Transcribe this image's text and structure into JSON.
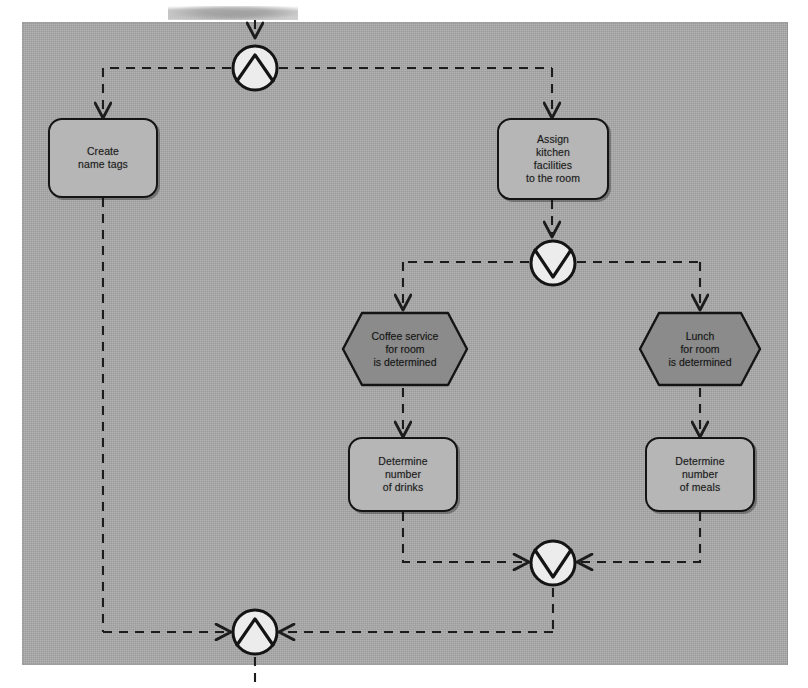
{
  "diagram": {
    "canvas": {
      "background_color": "#a9a9a9",
      "page_background_color": "#ffffff",
      "border_color": "#9a9a9a"
    },
    "style": {
      "function_fill": "#b6b6b6",
      "event_fill": "#8b8b8b",
      "connector_fill": "#e9e9e9",
      "line_color": "#1c1c1c",
      "text_color": "#1b1b1b",
      "edge_style": "dashed"
    }
  },
  "nodes": {
    "functions": [
      {
        "id": "create-name-tags",
        "type": "function",
        "label": "Create\nname tags",
        "lines": [
          "Create",
          "name tags"
        ]
      },
      {
        "id": "assign-kitchen-facilities",
        "type": "function",
        "label": "Assign\nkitchen\nfacilities\nto the room",
        "lines": [
          "Assign",
          "kitchen",
          "facilities",
          "to the room"
        ]
      },
      {
        "id": "determine-number-of-drinks",
        "type": "function",
        "label": "Determine\nnumber\nof drinks",
        "lines": [
          "Determine",
          "number",
          "of drinks"
        ]
      },
      {
        "id": "determine-number-of-meals",
        "type": "function",
        "label": "Determine\nnumber\nof meals",
        "lines": [
          "Determine",
          "number",
          "of meals"
        ]
      }
    ],
    "events": [
      {
        "id": "coffee-service-determined",
        "type": "event",
        "label": "Coffee service\nfor room\nis determined",
        "lines": [
          "Coffee service",
          "for room",
          "is determined"
        ]
      },
      {
        "id": "lunch-determined",
        "type": "event",
        "label": "Lunch\nfor room\nis determined",
        "lines": [
          "Lunch",
          "for room",
          "is determined"
        ]
      }
    ],
    "connectors": [
      {
        "id": "and-split-top",
        "type": "and",
        "glyph": "up-triangle",
        "role": "split",
        "symbol": "AND"
      },
      {
        "id": "xor-split-middle",
        "type": "xor",
        "glyph": "down-chevron",
        "role": "split",
        "symbol": "XOR"
      },
      {
        "id": "xor-join-lower",
        "type": "xor",
        "glyph": "down-chevron",
        "role": "join",
        "symbol": "XOR"
      },
      {
        "id": "and-join-bottom",
        "type": "and",
        "glyph": "up-triangle",
        "role": "join",
        "symbol": "AND"
      }
    ]
  },
  "edges": [
    {
      "from": "flow-in-top",
      "to": "and-split-top"
    },
    {
      "from": "and-split-top",
      "to": "create-name-tags"
    },
    {
      "from": "and-split-top",
      "to": "assign-kitchen-facilities"
    },
    {
      "from": "assign-kitchen-facilities",
      "to": "xor-split-middle"
    },
    {
      "from": "xor-split-middle",
      "to": "coffee-service-determined"
    },
    {
      "from": "xor-split-middle",
      "to": "lunch-determined"
    },
    {
      "from": "coffee-service-determined",
      "to": "determine-number-of-drinks"
    },
    {
      "from": "lunch-determined",
      "to": "determine-number-of-meals"
    },
    {
      "from": "determine-number-of-drinks",
      "to": "xor-join-lower"
    },
    {
      "from": "determine-number-of-meals",
      "to": "xor-join-lower"
    },
    {
      "from": "xor-join-lower",
      "to": "and-join-bottom"
    },
    {
      "from": "create-name-tags",
      "to": "and-join-bottom"
    },
    {
      "from": "and-join-bottom",
      "to": "flow-out-bottom"
    }
  ]
}
